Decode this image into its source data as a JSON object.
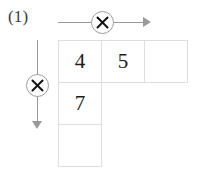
{
  "figure": {
    "problem_label": "(1)",
    "caption": "",
    "background_color": "#ffffff",
    "grid_line_color": "#dedede",
    "arrow_color": "#9a9a9a",
    "digit_color": "#1b1b1b"
  },
  "operators": {
    "horizontal": {
      "symbol": "×",
      "direction": "right",
      "label": "multiply-across-columns"
    },
    "vertical": {
      "symbol": "×",
      "direction": "down",
      "label": "multiply-down-rows"
    }
  },
  "grid": {
    "rows": [
      {
        "cells": [
          {
            "value": "4",
            "empty": false,
            "present": true
          },
          {
            "value": "5",
            "empty": false,
            "present": true
          },
          {
            "value": "",
            "empty": true,
            "present": true
          }
        ]
      },
      {
        "cells": [
          {
            "value": "7",
            "empty": false,
            "present": true
          },
          {
            "value": "",
            "empty": true,
            "present": false
          },
          {
            "value": "",
            "empty": true,
            "present": false
          }
        ]
      },
      {
        "cells": [
          {
            "value": "",
            "empty": true,
            "present": true
          },
          {
            "value": "",
            "empty": true,
            "present": false
          },
          {
            "value": "",
            "empty": true,
            "present": false
          }
        ]
      }
    ]
  }
}
